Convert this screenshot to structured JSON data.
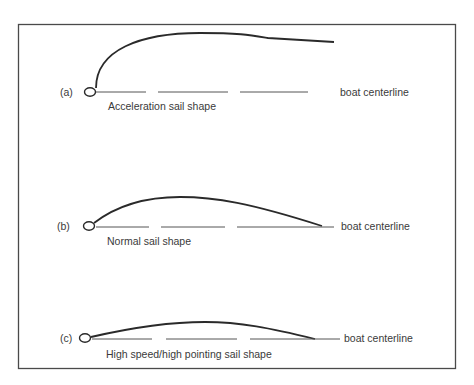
{
  "figure": {
    "panels": [
      {
        "id": "a",
        "label": "(a)",
        "caption": "Acceleration sail shape",
        "centerline_label": "boat centerline"
      },
      {
        "id": "b",
        "label": "(b)",
        "caption": "Normal sail shape",
        "centerline_label": "boat centerline"
      },
      {
        "id": "c",
        "label": "(c)",
        "caption": "High speed/high pointing sail shape",
        "centerline_label": "boat centerline"
      }
    ],
    "colors": {
      "stroke": "#2a2a2a",
      "frame": "#4a4a4a",
      "dash": "#555555",
      "text": "#3a3a3a"
    }
  }
}
